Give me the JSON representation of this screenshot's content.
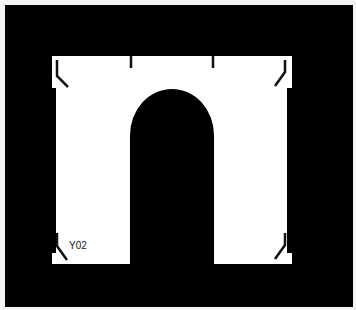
{
  "image": {
    "background_color": "#000000",
    "border_color": "#f4f4f4",
    "panel_color": "#ffffff",
    "mark_color": "#111111",
    "part_label": "Y02",
    "shape": "arch-template"
  }
}
